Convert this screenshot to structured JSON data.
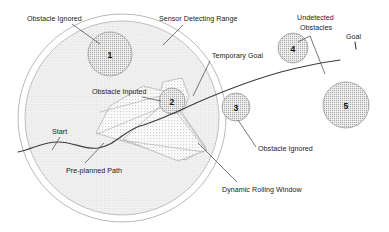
{
  "figure": {
    "background_color": "#ffffff",
    "ink_color": "#1a1a1a"
  },
  "labels": {
    "obstacle_ignored_top": "Obstacle Ignored",
    "sensor_detecting_range": "Sensor Detecting Range",
    "undetected_obstacles_line1": "Undetected",
    "undetected_obstacles_line2": "Obstacles",
    "goal": "Goal",
    "temporary_goal": "Temporary Goal",
    "obstacle_inputed": "Obstacle Inputed",
    "obstacle_ignored_right": "Obstacle Ignored",
    "start": "Start",
    "pre_planned_path": "Pre-planned Path",
    "dynamic_rolling_window": "Dynamic Rolling Window"
  },
  "obstacles": [
    {
      "id": "1",
      "label": "1",
      "shape": "circle",
      "cx": 110,
      "cy": 54,
      "r": 22,
      "fill": "#cfcfcf",
      "detected": false
    },
    {
      "id": "2",
      "label": "2",
      "shape": "circle",
      "cx": 172,
      "cy": 101,
      "r": 13,
      "fill": "#c9c9c9",
      "detected": true
    },
    {
      "id": "3",
      "label": "3",
      "shape": "circle",
      "cx": 236,
      "cy": 107,
      "r": 14,
      "fill": "#cfcfcf",
      "detected": false
    },
    {
      "id": "4",
      "label": "4",
      "shape": "circle",
      "cx": 293,
      "cy": 48,
      "r": 15,
      "fill": "#cfcfcf",
      "detected": false
    },
    {
      "id": "5",
      "label": "5",
      "shape": "circle",
      "cx": 346,
      "cy": 105,
      "r": 23,
      "fill": "#cfcfcf",
      "detected": false
    }
  ],
  "regions": {
    "dynamic_rolling_window": {
      "cx": 122,
      "cy": 118,
      "r": 97,
      "fill": "#e2e2e2"
    },
    "sensor_detecting_range": {
      "cx": 122,
      "cy": 118,
      "r": 104
    }
  },
  "colors": {
    "obstacle_fill": "#cfcfcf",
    "window_fill": "#e2e2e2",
    "shadow_fill": "#d6d6d6",
    "line": "#3d3d3d",
    "leader": "#4a4a4a",
    "outline": "#9a9a9a"
  }
}
